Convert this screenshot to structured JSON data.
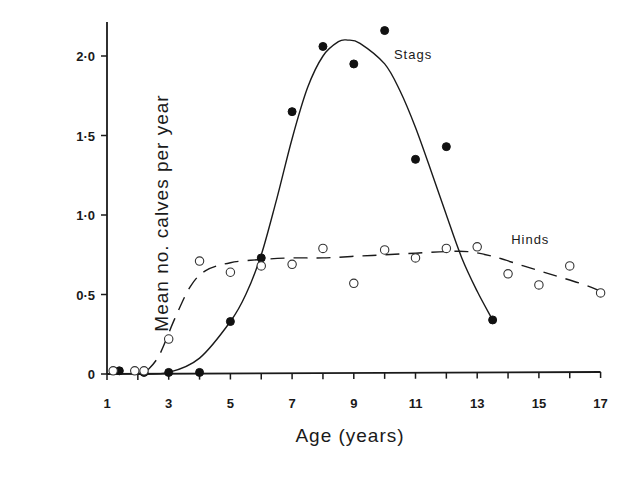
{
  "chart_data": {
    "type": "scatter",
    "title": "",
    "xlabel": "Age (years)",
    "ylabel": "Mean no. calves per year",
    "xlim": [
      1,
      17
    ],
    "ylim": [
      0,
      2.2
    ],
    "x_ticks": [
      1,
      3,
      5,
      7,
      9,
      11,
      13,
      15,
      17
    ],
    "x_minor_ticks": [
      2,
      4,
      6,
      8,
      10,
      12,
      14,
      16
    ],
    "y_ticks": [
      0,
      0.5,
      1.0,
      1.5,
      2.0
    ],
    "y_tick_labels": [
      "0",
      "0·5",
      "1·0",
      "1·5",
      "2·0"
    ],
    "grid": false,
    "legend": "inline labels",
    "series": [
      {
        "name": "Stags",
        "marker": "filled-circle",
        "line": "solid",
        "label_position": [
          10.3,
          1.98
        ],
        "points": [
          [
            1.4,
            0.02
          ],
          [
            2.2,
            0.01
          ],
          [
            3,
            0.01
          ],
          [
            4,
            0.01
          ],
          [
            5,
            0.33
          ],
          [
            6,
            0.73
          ],
          [
            7,
            1.65
          ],
          [
            8,
            2.06
          ],
          [
            9,
            1.95
          ],
          [
            10,
            2.16
          ],
          [
            11,
            1.35
          ],
          [
            12,
            1.43
          ],
          [
            13.5,
            0.34
          ]
        ],
        "fit_curve": [
          [
            2,
            0.0
          ],
          [
            3,
            0.01
          ],
          [
            4,
            0.1
          ],
          [
            5,
            0.33
          ],
          [
            5.5,
            0.5
          ],
          [
            6,
            0.75
          ],
          [
            6.5,
            1.1
          ],
          [
            7,
            1.48
          ],
          [
            7.5,
            1.8
          ],
          [
            8,
            2.0
          ],
          [
            8.5,
            2.09
          ],
          [
            8.8,
            2.1
          ],
          [
            9.2,
            2.08
          ],
          [
            10,
            1.95
          ],
          [
            10.5,
            1.78
          ],
          [
            11,
            1.55
          ],
          [
            11.5,
            1.28
          ],
          [
            12,
            1.0
          ],
          [
            12.5,
            0.73
          ],
          [
            13,
            0.52
          ],
          [
            13.5,
            0.34
          ]
        ]
      },
      {
        "name": "Hinds",
        "marker": "open-circle",
        "line": "dashed",
        "label_position": [
          14.1,
          0.82
        ],
        "points": [
          [
            1.2,
            0.02
          ],
          [
            1.9,
            0.02
          ],
          [
            2.2,
            0.02
          ],
          [
            3,
            0.22
          ],
          [
            4,
            0.71
          ],
          [
            5,
            0.64
          ],
          [
            6,
            0.68
          ],
          [
            7,
            0.69
          ],
          [
            8,
            0.79
          ],
          [
            9,
            0.57
          ],
          [
            10,
            0.78
          ],
          [
            11,
            0.73
          ],
          [
            12,
            0.79
          ],
          [
            13,
            0.8
          ],
          [
            14,
            0.63
          ],
          [
            15,
            0.56
          ],
          [
            16,
            0.68
          ],
          [
            17,
            0.51
          ]
        ],
        "fit_curve": [
          [
            2.3,
            0.02
          ],
          [
            2.7,
            0.12
          ],
          [
            3.2,
            0.35
          ],
          [
            3.7,
            0.55
          ],
          [
            4.2,
            0.65
          ],
          [
            5,
            0.7
          ],
          [
            6,
            0.72
          ],
          [
            7,
            0.73
          ],
          [
            8,
            0.73
          ],
          [
            9,
            0.74
          ],
          [
            10,
            0.75
          ],
          [
            11,
            0.76
          ],
          [
            12,
            0.77
          ],
          [
            12.7,
            0.77
          ],
          [
            13.5,
            0.74
          ],
          [
            14.5,
            0.68
          ],
          [
            15.5,
            0.62
          ],
          [
            16.5,
            0.56
          ],
          [
            17,
            0.52
          ]
        ]
      }
    ]
  }
}
